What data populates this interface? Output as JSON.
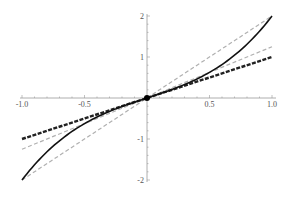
{
  "chart_data": {
    "type": "line",
    "title": "",
    "xlabel": "",
    "ylabel": "",
    "xlim": [
      -1,
      1
    ],
    "ylim": [
      -2,
      2
    ],
    "grid": false,
    "legend": "none",
    "x_ticks": [
      -1.0,
      -0.5,
      0.5,
      1.0
    ],
    "x_tick_labels": [
      "-1.0",
      "-0.5",
      "0.5",
      "1.0"
    ],
    "y_ticks": [
      -2,
      -1,
      1,
      2
    ],
    "y_tick_labels": [
      "-2",
      "-1",
      "1",
      "2"
    ],
    "series": [
      {
        "name": "curve",
        "style": "solid",
        "color": "#111111",
        "width": 1.6,
        "function": "x + x^3",
        "x": [
          -1,
          -0.75,
          -0.5,
          -0.25,
          0,
          0.25,
          0.5,
          0.75,
          1
        ],
        "values": [
          -2,
          -1.17,
          -0.63,
          -0.27,
          0,
          0.27,
          0.63,
          1.17,
          2
        ]
      },
      {
        "name": "line-slope-1",
        "style": "dashed",
        "color": "#222222",
        "width": 2.4,
        "function": "x",
        "x": [
          -1,
          1
        ],
        "values": [
          -1,
          1
        ]
      },
      {
        "name": "line-slope-2",
        "style": "dashed",
        "color": "#b0b0b0",
        "width": 1.2,
        "function": "2x",
        "x": [
          -1,
          1
        ],
        "values": [
          -2,
          2
        ]
      },
      {
        "name": "line-slope-1.25",
        "style": "dashed",
        "color": "#b0b0b0",
        "width": 1.2,
        "function": "1.25x",
        "x": [
          -1,
          1
        ],
        "values": [
          -1.25,
          1.25
        ]
      }
    ],
    "points": [
      {
        "x": 0,
        "y": 0,
        "label": "origin"
      }
    ]
  }
}
